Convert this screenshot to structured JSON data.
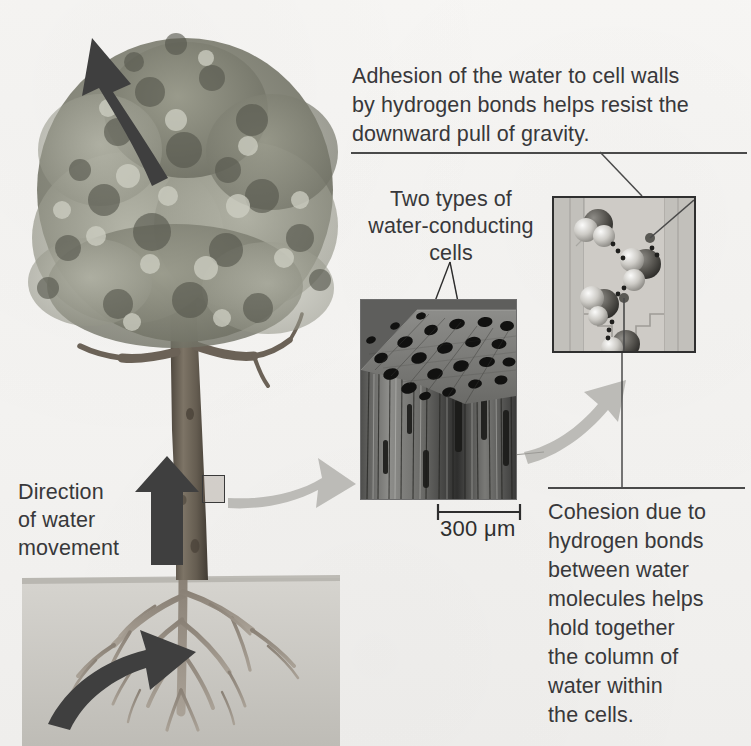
{
  "figure": {
    "background_color": "#f5f4f2",
    "text_color": "#38383a"
  },
  "annotations": {
    "adhesion": "Adhesion of the water to cell walls\nby hydrogen bonds helps resist the\ndownward pull of gravity.",
    "two_types": "Two types of\nwater-conducting\ncells",
    "cohesion": "Cohesion due to\nhydrogen bonds\nbetween water\nmolecules helps\nhold together\nthe column of\nwater within\nthe cells.",
    "direction": "Direction\nof water\nmovement"
  },
  "scale_bar": {
    "label": "300 μm",
    "length_value": 300,
    "unit": "μm"
  },
  "panels": {
    "micrograph": {
      "name": "wood-sem-micrograph",
      "caption": "Two types of water-conducting cells"
    },
    "molecular": {
      "name": "water-molecule-chain",
      "caption": "Cohesion and adhesion of water molecules"
    }
  },
  "arrows": {
    "transpiration": "upward curved arrow leaving canopy",
    "trunk_flow": "straight upward arrow along trunk",
    "root_uptake": "curved arrow entering roots",
    "zoom_to_micrograph": "gray arrow from trunk to micrograph",
    "zoom_to_molecular": "gray arrow from micrograph to molecular panel"
  },
  "colors": {
    "dark_arrow": "#3f3f3f",
    "gray_arrow": "#b9b8b4",
    "soil": "#c8c6c1",
    "foliage_dark": "#6e6f63",
    "foliage_light": "#b2b3a6",
    "trunk": "#6b6257",
    "rule": "#4a4a4a"
  }
}
